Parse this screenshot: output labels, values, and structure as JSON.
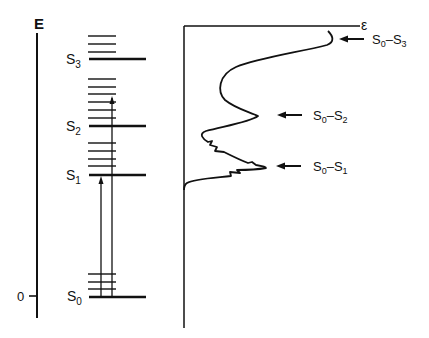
{
  "energy_diagram": {
    "axis_label": "E",
    "zero_label": "0",
    "states": [
      {
        "name": "S",
        "sub": "0",
        "y": 297
      },
      {
        "name": "S",
        "sub": "1",
        "y": 175
      },
      {
        "name": "S",
        "sub": "2",
        "y": 126
      },
      {
        "name": "S",
        "sub": "3",
        "y": 59
      }
    ],
    "vibrational_levels": {
      "S0": [
        274,
        282,
        289
      ],
      "S1": [
        143,
        151,
        159,
        166
      ],
      "S2": [
        79,
        87,
        94,
        102,
        110,
        118
      ],
      "S3": [
        36,
        44,
        52
      ]
    },
    "transitions": [
      {
        "from": "S0",
        "to": "S1",
        "x": 101
      },
      {
        "from": "S0",
        "to": "S2 (vibronic)",
        "x": 112
      }
    ]
  },
  "spectrum": {
    "axis_label": "ε",
    "bands": [
      {
        "label_main": "S",
        "sub1": "0",
        "dash": "–",
        "label_end": "S",
        "sub2": "3",
        "y": 39
      },
      {
        "label_main": "S",
        "sub1": "0",
        "dash": "–",
        "label_end": "S",
        "sub2": "2",
        "y": 115
      },
      {
        "label_main": "S",
        "sub1": "0",
        "dash": "–",
        "label_end": "S",
        "sub2": "1",
        "y": 166
      }
    ]
  }
}
